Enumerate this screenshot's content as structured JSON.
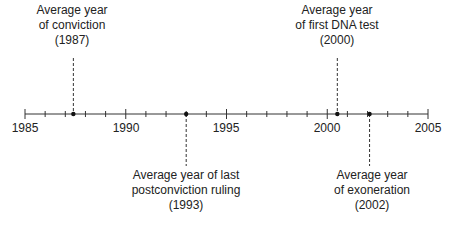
{
  "chart_data": {
    "type": "timeline",
    "axis": {
      "min": 1985,
      "max": 2005,
      "major_ticks": [
        1985,
        1990,
        1995,
        2000,
        2005
      ],
      "minor_step": 1
    },
    "events": [
      {
        "name": "conviction",
        "year": 1987.4,
        "position": "above",
        "lines": [
          "Average year",
          "of conviction",
          "(1987)"
        ]
      },
      {
        "name": "last-postconviction-ruling",
        "year": 1993.0,
        "position": "below",
        "lines": [
          "Average year of last",
          "postconviction ruling",
          "(1993)"
        ]
      },
      {
        "name": "first-dna-test",
        "year": 2000.5,
        "position": "above",
        "lines": [
          "Average year",
          "of first DNA test",
          "(2000)"
        ]
      },
      {
        "name": "exoneration",
        "year": 2002.1,
        "position": "below",
        "lines": [
          "Average year",
          "of exoneration",
          "(2002)"
        ]
      }
    ]
  },
  "axis_labels": [
    "1985",
    "1990",
    "1995",
    "2000",
    "2005"
  ],
  "labels": {
    "conviction": [
      "Average year",
      "of conviction",
      "(1987)"
    ],
    "ruling": [
      "Average year of last",
      "postconviction ruling",
      "(1993)"
    ],
    "dna": [
      "Average year",
      "of first DNA test",
      "(2000)"
    ],
    "exoneration": [
      "Average year",
      "of exoneration",
      "(2002)"
    ]
  }
}
